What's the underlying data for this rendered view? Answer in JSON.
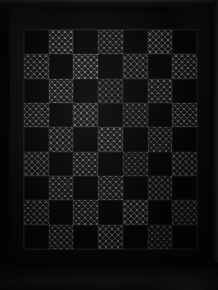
{
  "image": {
    "subject": "patchwork quilt",
    "scene_description": "Dark photograph of a checkerboard patchwork quilt displayed flat against a black background",
    "width_px": 218,
    "height_px": 290
  },
  "colors": {
    "background": "#050505",
    "quilt_border": "#080808",
    "solid_patch": "#050505",
    "printed_patch_ground": "#101010",
    "printed_patch_motif": "#e1e1e1",
    "seam_line": "#1c1c1c",
    "edge_highlight": "#2a2a2a"
  },
  "quilt": {
    "border_label": "solid black outer border",
    "grid": {
      "columns": 7,
      "rows": 9,
      "patch_types": [
        "solid",
        "print"
      ],
      "layout": [
        [
          "solid",
          "print",
          "solid",
          "print",
          "solid",
          "print",
          "solid"
        ],
        [
          "print",
          "solid",
          "print",
          "solid",
          "print",
          "solid",
          "print"
        ],
        [
          "solid",
          "print",
          "solid",
          "print",
          "solid",
          "print",
          "solid"
        ],
        [
          "print",
          "solid",
          "print",
          "solid",
          "print",
          "solid",
          "print"
        ],
        [
          "solid",
          "print",
          "solid",
          "print",
          "solid",
          "print",
          "solid"
        ],
        [
          "print",
          "solid",
          "print",
          "solid",
          "print",
          "solid",
          "print"
        ],
        [
          "solid",
          "print",
          "solid",
          "print",
          "solid",
          "print",
          "solid"
        ],
        [
          "print",
          "solid",
          "print",
          "solid",
          "print",
          "solid",
          "print"
        ],
        [
          "solid",
          "print",
          "solid",
          "print",
          "solid",
          "print",
          "solid"
        ]
      ]
    }
  }
}
